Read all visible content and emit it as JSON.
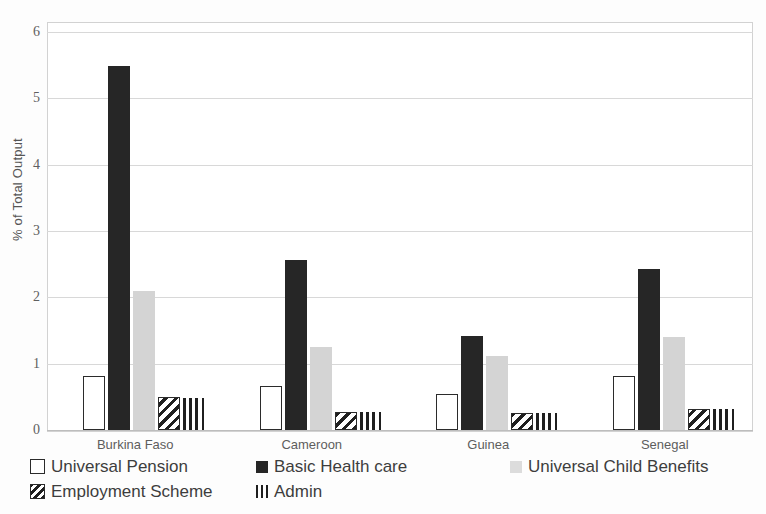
{
  "chart_data": {
    "type": "bar",
    "title": "",
    "subtitle": "",
    "xlabel": "",
    "ylabel": "% of Total Output",
    "ylim": [
      0,
      6
    ],
    "ytick_labels": [
      "0",
      "1",
      "2",
      "3",
      "4",
      "5",
      "6"
    ],
    "ytick_values": [
      0,
      1,
      2,
      3,
      4,
      5,
      6
    ],
    "grid": true,
    "legend_position": "bottom",
    "categories": [
      "Burkina Faso",
      "Cameroon",
      "Guinea",
      "Senegal"
    ],
    "series": [
      {
        "name": "Universal  Pension",
        "style": "outline",
        "color": "#ffffff",
        "edge_color": "#2b2b2b",
        "values": [
          0.81,
          0.67,
          0.54,
          0.81
        ]
      },
      {
        "name": "Basic Health care",
        "style": "solid-dark",
        "color": "#262626",
        "edge_color": "#262626",
        "values": [
          5.49,
          2.57,
          1.42,
          2.42
        ]
      },
      {
        "name": "Universal Child Benefits",
        "style": "light-gray",
        "color": "#d4d4d4",
        "edge_color": "#d4d4d4",
        "values": [
          2.09,
          1.25,
          1.12,
          1.4
        ]
      },
      {
        "name": "Employment Scheme",
        "style": "diagonal",
        "color": "#ffffff",
        "edge_color": "#1f1f1f",
        "values": [
          0.5,
          0.27,
          0.25,
          0.31
        ]
      },
      {
        "name": "Admin",
        "style": "vertical",
        "color": "#ffffff",
        "edge_color": "#1f1f1f",
        "values": [
          0.49,
          0.27,
          0.25,
          0.31
        ]
      }
    ]
  },
  "axes": {
    "y_title": "% of Total Output"
  },
  "legend": {
    "items": [
      {
        "label": "Universal  Pension",
        "style": "outline",
        "row": 0,
        "col": 0
      },
      {
        "label": "Basic Health care",
        "style": "solid-dark",
        "row": 0,
        "col": 1
      },
      {
        "label": "Universal Child Benefits",
        "style": "light-gray",
        "row": 0,
        "col": 2
      },
      {
        "label": "Employment Scheme",
        "style": "diagonal",
        "row": 1,
        "col": 0
      },
      {
        "label": "Admin",
        "style": "vertical",
        "row": 1,
        "col": 1
      }
    ]
  }
}
